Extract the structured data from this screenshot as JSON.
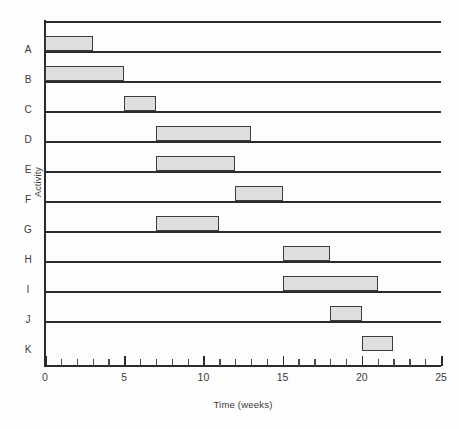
{
  "chart_data": {
    "type": "bar",
    "orientation": "horizontal",
    "subtype": "gantt",
    "title": "",
    "xlabel": "Time (weeks)",
    "ylabel": "Activity",
    "xlim": [
      0,
      25
    ],
    "xticks": [
      0,
      1,
      2,
      3,
      4,
      5,
      6,
      7,
      8,
      9,
      10,
      11,
      12,
      13,
      14,
      15,
      16,
      17,
      18,
      19,
      20,
      21,
      22,
      23,
      24,
      25
    ],
    "xtick_labels": [
      "0",
      "5",
      "10",
      "15",
      "20",
      "25"
    ],
    "xtick_label_values": [
      0,
      5,
      10,
      15,
      20,
      25
    ],
    "grid": false,
    "legend": null,
    "categories": [
      "A",
      "B",
      "C",
      "D",
      "E",
      "F",
      "G",
      "H",
      "I",
      "J",
      "K"
    ],
    "bars": [
      {
        "category": "A",
        "start": 0,
        "end": 3,
        "duration": 3
      },
      {
        "category": "B",
        "start": 0,
        "end": 5,
        "duration": 5
      },
      {
        "category": "C",
        "start": 5,
        "end": 7,
        "duration": 2
      },
      {
        "category": "D",
        "start": 7,
        "end": 13,
        "duration": 6
      },
      {
        "category": "E",
        "start": 7,
        "end": 12,
        "duration": 5
      },
      {
        "category": "F",
        "start": 12,
        "end": 15,
        "duration": 3
      },
      {
        "category": "G",
        "start": 7,
        "end": 11,
        "duration": 4
      },
      {
        "category": "H",
        "start": 15,
        "end": 18,
        "duration": 3
      },
      {
        "category": "I",
        "start": 15,
        "end": 21,
        "duration": 6
      },
      {
        "category": "J",
        "start": 18,
        "end": 20,
        "duration": 2
      },
      {
        "category": "K",
        "start": 20,
        "end": 22,
        "duration": 2
      }
    ],
    "colors": {
      "bar_fill": "#dedede",
      "bar_stroke": "#3c3c3c",
      "axis": "#2b2b2b",
      "text": "#3a3a3a",
      "background": "#fdfdfd"
    }
  }
}
